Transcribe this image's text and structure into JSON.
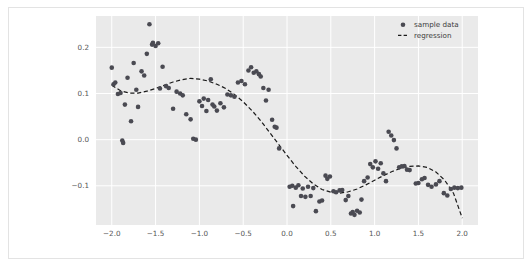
{
  "figure": {
    "background_color": "#ffffff",
    "border_color": "#e3e3e3",
    "axes_background_color": "#eaeaea",
    "grid_color": "#ffffff",
    "tick_label_color": "#555555"
  },
  "chart_data": {
    "type": "scatter",
    "title": "",
    "xlabel": "",
    "ylabel": "",
    "xlim": [
      -2.18,
      2.18
    ],
    "ylim": [
      -0.185,
      0.268
    ],
    "grid": true,
    "legend_position": "upper right",
    "xticks": [
      -2.0,
      -1.5,
      -1.0,
      -0.5,
      0.0,
      0.5,
      1.0,
      1.5,
      2.0
    ],
    "xtick_labels": [
      "-2.0",
      "-1.5",
      "-1.0",
      "-0.5",
      "0.0",
      "0.5",
      "1.0",
      "1.5",
      "2.0"
    ],
    "yticks": [
      -0.1,
      0.0,
      0.1,
      0.2
    ],
    "ytick_labels": [
      "-0.1",
      "0.0",
      "0.1",
      "0.2"
    ],
    "series": [
      {
        "name": "sample data",
        "type": "scatter",
        "marker": "circle",
        "color": "#4a4a52",
        "marker_size": 4.6,
        "points": [
          [
            -2.0,
            0.156
          ],
          [
            -1.98,
            0.12
          ],
          [
            -1.96,
            0.124
          ],
          [
            -1.93,
            0.099
          ],
          [
            -1.9,
            0.101
          ],
          [
            -1.88,
            -0.002
          ],
          [
            -1.87,
            -0.007
          ],
          [
            -1.85,
            0.076
          ],
          [
            -1.82,
            0.134
          ],
          [
            -1.78,
            0.04
          ],
          [
            -1.75,
            0.166
          ],
          [
            -1.72,
            0.108
          ],
          [
            -1.7,
            0.071
          ],
          [
            -1.66,
            0.148
          ],
          [
            -1.63,
            0.139
          ],
          [
            -1.6,
            0.186
          ],
          [
            -1.57,
            0.25
          ],
          [
            -1.54,
            0.206
          ],
          [
            -1.53,
            0.21
          ],
          [
            -1.5,
            0.203
          ],
          [
            -1.47,
            0.209
          ],
          [
            -1.45,
            0.111
          ],
          [
            -1.42,
            0.158
          ],
          [
            -1.38,
            0.116
          ],
          [
            -1.35,
            0.112
          ],
          [
            -1.3,
            0.067
          ],
          [
            -1.26,
            0.104
          ],
          [
            -1.22,
            0.1
          ],
          [
            -1.19,
            0.096
          ],
          [
            -1.15,
            0.055
          ],
          [
            -1.1,
            0.044
          ],
          [
            -1.07,
            0.002
          ],
          [
            -1.04,
            0.0
          ],
          [
            -1.0,
            0.083
          ],
          [
            -0.97,
            0.073
          ],
          [
            -0.95,
            0.089
          ],
          [
            -0.92,
            0.062
          ],
          [
            -0.9,
            0.086
          ],
          [
            -0.87,
            0.131
          ],
          [
            -0.85,
            0.076
          ],
          [
            -0.83,
            0.072
          ],
          [
            -0.8,
            0.063
          ],
          [
            -0.76,
            0.079
          ],
          [
            -0.72,
            0.07
          ],
          [
            -0.68,
            0.098
          ],
          [
            -0.64,
            0.096
          ],
          [
            -0.6,
            0.093
          ],
          [
            -0.56,
            0.124
          ],
          [
            -0.52,
            0.127
          ],
          [
            -0.48,
            0.12
          ],
          [
            -0.44,
            0.15
          ],
          [
            -0.41,
            0.157
          ],
          [
            -0.38,
            0.145
          ],
          [
            -0.35,
            0.148
          ],
          [
            -0.32,
            0.142
          ],
          [
            -0.3,
            0.137
          ],
          [
            -0.27,
            0.112
          ],
          [
            -0.24,
            0.085
          ],
          [
            -0.21,
            0.108
          ],
          [
            -0.17,
            0.043
          ],
          [
            -0.14,
            0.028
          ],
          [
            -0.12,
            0.026
          ],
          [
            -0.09,
            -0.019
          ],
          [
            0.03,
            -0.102
          ],
          [
            0.06,
            -0.1
          ],
          [
            0.07,
            -0.144
          ],
          [
            0.1,
            -0.104
          ],
          [
            0.13,
            -0.099
          ],
          [
            0.16,
            -0.122
          ],
          [
            0.18,
            -0.106
          ],
          [
            0.21,
            -0.124
          ],
          [
            0.24,
            -0.102
          ],
          [
            0.27,
            -0.122
          ],
          [
            0.3,
            -0.105
          ],
          [
            0.33,
            -0.155
          ],
          [
            0.37,
            -0.134
          ],
          [
            0.4,
            -0.132
          ],
          [
            0.44,
            -0.078
          ],
          [
            0.46,
            -0.085
          ],
          [
            0.49,
            -0.08
          ],
          [
            0.53,
            -0.112
          ],
          [
            0.56,
            -0.114
          ],
          [
            0.6,
            -0.11
          ],
          [
            0.63,
            -0.109
          ],
          [
            0.67,
            -0.131
          ],
          [
            0.7,
            -0.122
          ],
          [
            0.73,
            -0.16
          ],
          [
            0.75,
            -0.157
          ],
          [
            0.77,
            -0.163
          ],
          [
            0.8,
            -0.154
          ],
          [
            0.83,
            -0.158
          ],
          [
            0.85,
            -0.13
          ],
          [
            0.88,
            -0.09
          ],
          [
            0.92,
            -0.082
          ],
          [
            0.95,
            -0.053
          ],
          [
            0.98,
            -0.06
          ],
          [
            1.01,
            -0.047
          ],
          [
            1.04,
            -0.063
          ],
          [
            1.07,
            -0.051
          ],
          [
            1.1,
            -0.073
          ],
          [
            1.13,
            -0.09
          ],
          [
            1.16,
            0.017
          ],
          [
            1.19,
            0.009
          ],
          [
            1.22,
            -0.001
          ],
          [
            1.25,
            -0.019
          ],
          [
            1.28,
            -0.06
          ],
          [
            1.31,
            -0.058
          ],
          [
            1.34,
            -0.057
          ],
          [
            1.37,
            -0.065
          ],
          [
            1.4,
            -0.066
          ],
          [
            1.47,
            -0.095
          ],
          [
            1.5,
            -0.094
          ],
          [
            1.54,
            -0.086
          ],
          [
            1.57,
            -0.083
          ],
          [
            1.61,
            -0.098
          ],
          [
            1.65,
            -0.102
          ],
          [
            1.7,
            -0.097
          ],
          [
            1.74,
            -0.09
          ],
          [
            1.79,
            -0.116
          ],
          [
            1.83,
            -0.121
          ],
          [
            1.87,
            -0.107
          ],
          [
            1.91,
            -0.104
          ],
          [
            1.95,
            -0.105
          ],
          [
            1.99,
            -0.104
          ]
        ]
      },
      {
        "name": "regression",
        "type": "line",
        "style": "dashed",
        "color": "#1a1a1a",
        "line_width": 1.2,
        "points": [
          [
            -2.0,
            0.118
          ],
          [
            -1.9,
            0.106
          ],
          [
            -1.8,
            0.101
          ],
          [
            -1.7,
            0.101
          ],
          [
            -1.6,
            0.105
          ],
          [
            -1.5,
            0.111
          ],
          [
            -1.4,
            0.118
          ],
          [
            -1.3,
            0.125
          ],
          [
            -1.2,
            0.13
          ],
          [
            -1.1,
            0.133
          ],
          [
            -1.0,
            0.131
          ],
          [
            -0.9,
            0.127
          ],
          [
            -0.8,
            0.12
          ],
          [
            -0.7,
            0.111
          ],
          [
            -0.6,
            0.098
          ],
          [
            -0.5,
            0.082
          ],
          [
            -0.4,
            0.063
          ],
          [
            -0.3,
            0.041
          ],
          [
            -0.2,
            0.016
          ],
          [
            -0.1,
            -0.009
          ],
          [
            0.0,
            -0.034
          ],
          [
            0.1,
            -0.058
          ],
          [
            0.2,
            -0.079
          ],
          [
            0.3,
            -0.096
          ],
          [
            0.4,
            -0.108
          ],
          [
            0.5,
            -0.114
          ],
          [
            0.6,
            -0.116
          ],
          [
            0.7,
            -0.113
          ],
          [
            0.8,
            -0.107
          ],
          [
            0.9,
            -0.098
          ],
          [
            1.0,
            -0.088
          ],
          [
            1.1,
            -0.078
          ],
          [
            1.2,
            -0.069
          ],
          [
            1.3,
            -0.062
          ],
          [
            1.4,
            -0.058
          ],
          [
            1.5,
            -0.057
          ],
          [
            1.6,
            -0.06
          ],
          [
            1.7,
            -0.07
          ],
          [
            1.8,
            -0.088
          ],
          [
            1.9,
            -0.116
          ],
          [
            2.0,
            -0.17
          ]
        ]
      }
    ]
  },
  "legend": {
    "entries": [
      {
        "label": "sample data",
        "marker": "circle",
        "color": "#4a4a52"
      },
      {
        "label": "regression",
        "marker": "dashed-line",
        "color": "#1a1a1a"
      }
    ]
  }
}
